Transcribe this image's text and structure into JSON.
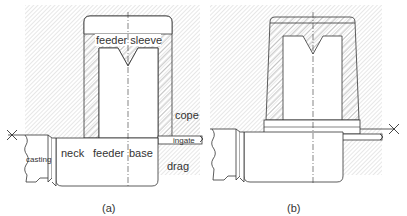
{
  "figure": {
    "panels": [
      {
        "id": "a",
        "caption": "(a)",
        "labels": {
          "feeder_sleeve": "feeder sleeve",
          "cope": "cope",
          "ingate": "ingate",
          "casting": "casting",
          "neck": "neck",
          "feeder": "feeder",
          "base": "base",
          "drag": "drag"
        }
      },
      {
        "id": "b",
        "caption": "(b)",
        "labels": {}
      }
    ],
    "colors": {
      "line": "#333333",
      "hatch": "#9a9a9a",
      "sand_hatch": "#c8c8c8",
      "background": "#ffffff"
    }
  }
}
